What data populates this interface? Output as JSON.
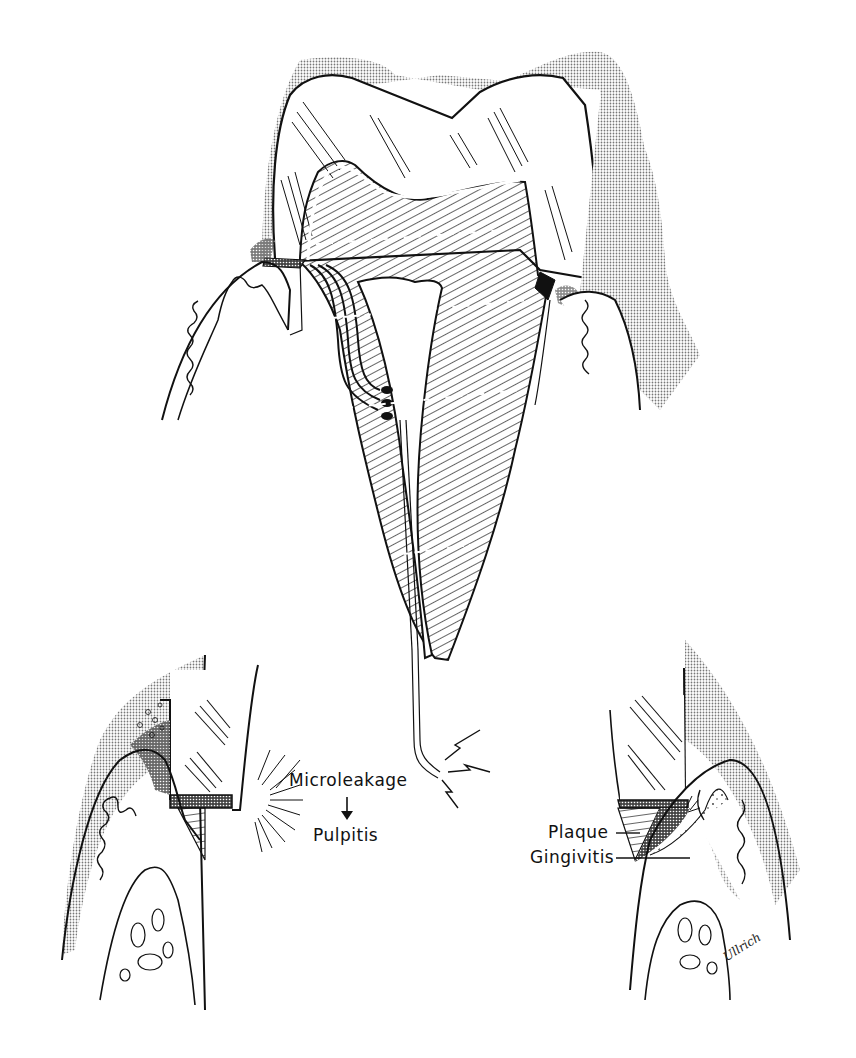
{
  "figure": {
    "colors": {
      "ink": "#111111",
      "stipple": "#bdbdbd",
      "background": "#ffffff"
    }
  },
  "labels": {
    "microleakage": "Microleakage",
    "arrow": "↓",
    "pulpitis": "Pulpitis",
    "plaque": "Plaque",
    "gingivitis": "Gingivitis"
  },
  "signature": "Ullrich"
}
